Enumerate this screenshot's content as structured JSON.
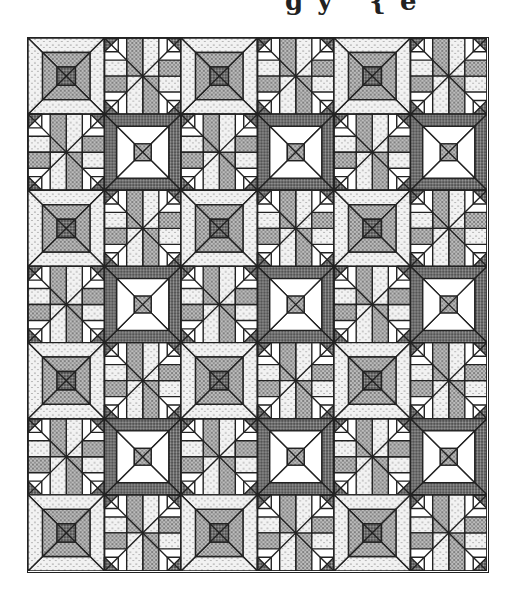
{
  "title_fragment": "gy {e",
  "quilt": {
    "columns": 6,
    "rows": 7,
    "block_types": [
      "light-square-in-square",
      "pinwheel-star",
      "dark-square-in-square"
    ],
    "layout": [
      [
        "light",
        "star",
        "light",
        "star",
        "light",
        "star"
      ],
      [
        "star",
        "dark",
        "star",
        "dark",
        "star",
        "dark"
      ],
      [
        "light",
        "star",
        "light",
        "star",
        "light",
        "star"
      ],
      [
        "star",
        "dark",
        "star",
        "dark",
        "star",
        "dark"
      ],
      [
        "light",
        "star",
        "light",
        "star",
        "light",
        "star"
      ],
      [
        "star",
        "dark",
        "star",
        "dark",
        "star",
        "dark"
      ],
      [
        "light",
        "star",
        "light",
        "star",
        "light",
        "star"
      ]
    ],
    "colors": {
      "line": "#222222",
      "light_fill": "#e6e6e6",
      "medium_fill": "#9a9a9a",
      "dark_fill": "#5e5e5e",
      "white": "#ffffff"
    }
  }
}
